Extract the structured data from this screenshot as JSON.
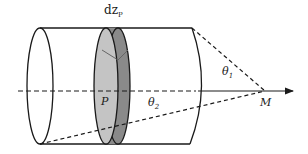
{
  "diagram": {
    "labels": {
      "dz": "dz",
      "dz_sub": "P",
      "point_p": "P",
      "theta1": "θ",
      "theta1_sub": "1",
      "theta2": "θ",
      "theta2_sub": "2",
      "point_m": "M"
    },
    "colors": {
      "line": "#1a1a1a",
      "disk_light": "#c4c4c4",
      "disk_dark": "#8a8a8a",
      "background": "#ffffff"
    }
  }
}
